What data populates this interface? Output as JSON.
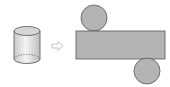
{
  "diagram": {
    "colors": {
      "background": "#ffffff",
      "fill": "#b4b4b4",
      "stroke": "#555555",
      "cylinder_top": "#d6d6d6",
      "cylinder_body_light": "#f2f2f2",
      "cylinder_body_dark": "#c4c4c4",
      "arrow": "#bdbdbd"
    },
    "cylinder": {
      "cx": 27,
      "top_y": 31,
      "bottom_y": 59,
      "rx": 13,
      "ry": 4.5
    },
    "arrow": {
      "x": 52,
      "y": 46,
      "glyph": "hollow-right-arrow"
    },
    "net": {
      "rectangle": {
        "x": 76,
        "y": 31,
        "width": 89,
        "height": 28
      },
      "top_circle": {
        "cx": 94,
        "cy": 18,
        "r": 13
      },
      "bottom_circle": {
        "cx": 147,
        "cy": 71,
        "r": 13
      }
    }
  }
}
